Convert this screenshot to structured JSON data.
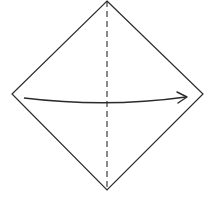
{
  "diagram": {
    "title": "Origami fold step: fold left corner to right along vertical crease",
    "type": "origami-instruction",
    "colors": {
      "background": "#ffffff",
      "stroke": "#2b2b2b"
    },
    "paper": {
      "shape": "diamond",
      "vertices": {
        "top": [
          107,
          1
        ],
        "right": [
          203,
          94
        ],
        "bottom": [
          107,
          190
        ],
        "left": [
          12,
          94
        ]
      }
    },
    "crease": {
      "style": "dashed",
      "meaning": "valley fold line",
      "from": [
        107,
        1
      ],
      "to": [
        107,
        190
      ]
    },
    "arrow": {
      "direction": "left-to-right",
      "from": [
        24,
        98
      ],
      "to": [
        186,
        97
      ],
      "sag": 6
    }
  }
}
